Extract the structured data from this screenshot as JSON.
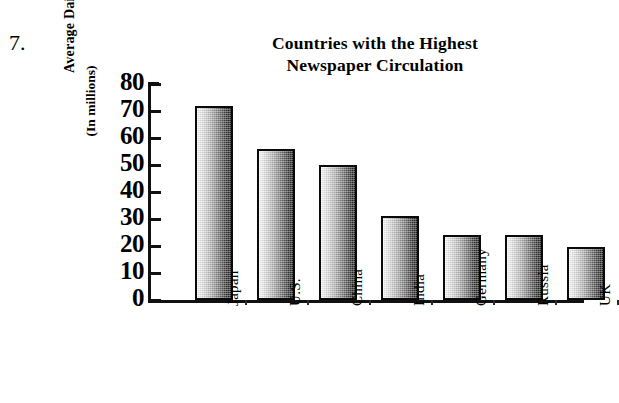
{
  "problem_number": "7.",
  "chart_data": {
    "type": "bar",
    "title": "Countries with the Highest Newspaper Circulation",
    "title_lines": [
      "Countries with the Highest",
      "Newspaper Circulation"
    ],
    "xlabel": "",
    "ylabel": "Average Daily Circulation",
    "ylabel_sub": "(In millions)",
    "categories": [
      "Japan",
      "U.S.",
      "China",
      "India",
      "Germany",
      "Russia",
      "UK"
    ],
    "values": [
      72,
      56,
      50,
      31,
      24,
      24,
      19.5
    ],
    "ylim": [
      0,
      80
    ],
    "ytick_labels": [
      "80",
      "70",
      "60",
      "50",
      "40",
      "30",
      "20",
      "10",
      "0"
    ],
    "ytick_values": [
      80,
      70,
      60,
      50,
      40,
      30,
      20,
      10,
      0
    ],
    "ytick_step": 10,
    "grid": false,
    "legend": false,
    "bar_fill": "gradient-light-to-dark",
    "bar_border_color": "#0a0a0a",
    "axis_color": "#111111",
    "background": "#ffffff"
  }
}
